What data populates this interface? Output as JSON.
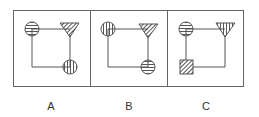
{
  "figure": {
    "stroke_color": "#555555",
    "panels": [
      {
        "label": "A",
        "top_left": {
          "shape": "circle",
          "hatch": "horizontal"
        },
        "top_right": {
          "shape": "triangle",
          "hatch": "diagonal"
        },
        "bottom": {
          "shape": "circle",
          "hatch": "vertical",
          "position": "bottom-right"
        }
      },
      {
        "label": "B",
        "top_left": {
          "shape": "circle",
          "hatch": "vertical"
        },
        "top_right": {
          "shape": "triangle",
          "hatch": "diagonal"
        },
        "bottom": {
          "shape": "circle",
          "hatch": "horizontal",
          "position": "bottom-right"
        }
      },
      {
        "label": "C",
        "top_left": {
          "shape": "circle",
          "hatch": "horizontal"
        },
        "top_right": {
          "shape": "triangle",
          "hatch": "vertical"
        },
        "bottom": {
          "shape": "square",
          "hatch": "diagonal",
          "position": "bottom-left"
        }
      }
    ]
  }
}
